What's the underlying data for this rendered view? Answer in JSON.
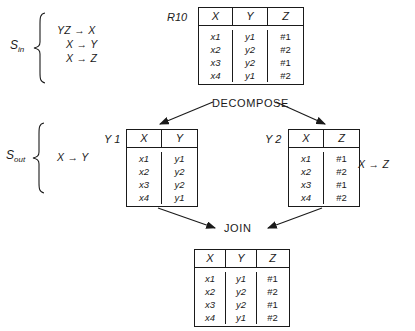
{
  "s_in": {
    "label": "S",
    "subscript": "in",
    "dependencies": [
      "YZ → X",
      "X → Y",
      "X → Z"
    ]
  },
  "s_out": {
    "label": "S",
    "subscript": "out",
    "dependencies": [
      "X → Y"
    ]
  },
  "side_dependency": "X → Z",
  "operations": {
    "decompose": "DECOMPOSE",
    "join": "JOIN"
  },
  "tables": {
    "r10": {
      "name": "R10",
      "columns": [
        "X",
        "Y",
        "Z"
      ],
      "rows": [
        [
          "x1",
          "y1",
          "#1"
        ],
        [
          "x2",
          "y2",
          "#2"
        ],
        [
          "x3",
          "y2",
          "#1"
        ],
        [
          "x4",
          "y1",
          "#2"
        ]
      ]
    },
    "y1": {
      "name": "Y 1",
      "columns": [
        "X",
        "Y"
      ],
      "rows": [
        [
          "x1",
          "y1"
        ],
        [
          "x2",
          "y2"
        ],
        [
          "x3",
          "y2"
        ],
        [
          "x4",
          "y1"
        ]
      ]
    },
    "y2": {
      "name": "Y 2",
      "columns": [
        "X",
        "Z"
      ],
      "rows": [
        [
          "x1",
          "#1"
        ],
        [
          "x2",
          "#2"
        ],
        [
          "x3",
          "#1"
        ],
        [
          "x4",
          "#2"
        ]
      ]
    },
    "joined": {
      "name": "",
      "columns": [
        "X",
        "Y",
        "Z"
      ],
      "rows": [
        [
          "x1",
          "y1",
          "#1"
        ],
        [
          "x2",
          "y2",
          "#2"
        ],
        [
          "x3",
          "y2",
          "#1"
        ],
        [
          "x4",
          "y1",
          "#2"
        ]
      ]
    }
  }
}
